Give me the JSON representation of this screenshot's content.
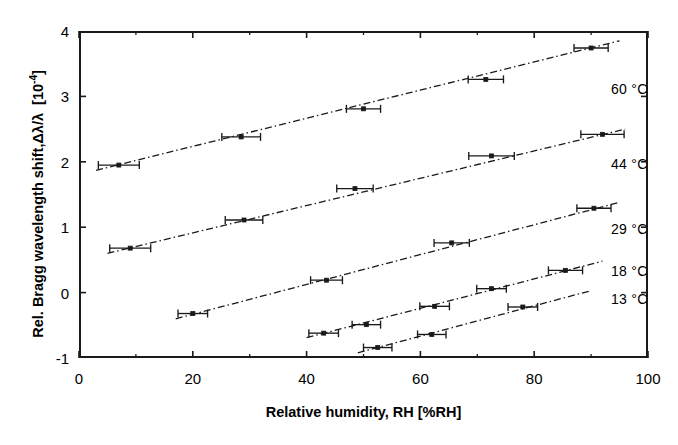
{
  "chart_data": {
    "type": "scatter",
    "title": "",
    "xlabel": "Relative humidity, RH   [%RH]",
    "ylabel": "Rel. Bragg wavelength shift,",
    "ylabel_symbol": "Δλ/λ",
    "ylabel_units": "[10",
    "ylabel_units_exp": "-4",
    "ylabel_units_close": "]",
    "xlim": [
      0,
      100
    ],
    "ylim": [
      -1,
      4
    ],
    "xticks": [
      0,
      20,
      40,
      60,
      80,
      100
    ],
    "xtick_labels": [
      "0",
      "20",
      "40",
      "60",
      "80",
      "100"
    ],
    "xminor_step": 10,
    "yticks": [
      -1,
      0,
      1,
      2,
      3,
      4
    ],
    "ytick_labels": [
      "-1",
      "0",
      "1",
      "2",
      "3",
      "4"
    ],
    "grid": false,
    "legend_position": "right-inline",
    "marker": "square",
    "errorbars": "x",
    "fit_line_style": "dash-dot",
    "series": [
      {
        "name": "60 °C",
        "label": "60 °C",
        "label_x": 93.5,
        "label_y": 3.12,
        "color": "#1a1a1a",
        "points": [
          {
            "x": 7.0,
            "y": 1.95,
            "xerr": 3.6
          },
          {
            "x": 28.5,
            "y": 2.38,
            "xerr": 3.4
          },
          {
            "x": 50.0,
            "y": 2.81,
            "xerr": 3.0
          },
          {
            "x": 71.5,
            "y": 3.26,
            "xerr": 3.1
          },
          {
            "x": 90.0,
            "y": 3.74,
            "xerr": 3.0
          }
        ],
        "fit": {
          "x0": 3.0,
          "y0": 1.87,
          "x1": 95.0,
          "y1": 3.85
        }
      },
      {
        "name": "44 °C",
        "label": "44 °C",
        "label_x": 93.5,
        "label_y": 1.97,
        "color": "#1a1a1a",
        "points": [
          {
            "x": 9.0,
            "y": 0.68,
            "xerr": 3.6
          },
          {
            "x": 29.0,
            "y": 1.11,
            "xerr": 3.3
          },
          {
            "x": 48.5,
            "y": 1.59,
            "xerr": 3.2
          },
          {
            "x": 72.5,
            "y": 2.09,
            "xerr": 4.0
          },
          {
            "x": 92.0,
            "y": 2.42,
            "xerr": 3.8
          }
        ],
        "fit": {
          "x0": 5.0,
          "y0": 0.6,
          "x1": 96.0,
          "y1": 2.5
        }
      },
      {
        "name": "29 °C",
        "label": "29 °C",
        "label_x": 93.5,
        "label_y": 0.97,
        "color": "#1a1a1a",
        "points": [
          {
            "x": 20.0,
            "y": -0.32,
            "xerr": 2.6
          },
          {
            "x": 43.5,
            "y": 0.19,
            "xerr": 2.8
          },
          {
            "x": 65.5,
            "y": 0.76,
            "xerr": 3.1
          },
          {
            "x": 90.5,
            "y": 1.29,
            "xerr": 3.0
          }
        ],
        "fit": {
          "x0": 17.0,
          "y0": -0.4,
          "x1": 95.0,
          "y1": 1.38
        }
      },
      {
        "name": "18 °C",
        "label": "18 °C",
        "label_x": 93.5,
        "label_y": 0.33,
        "color": "#1a1a1a",
        "points": [
          {
            "x": 43.0,
            "y": -0.62,
            "xerr": 2.6
          },
          {
            "x": 50.5,
            "y": -0.49,
            "xerr": 2.5
          },
          {
            "x": 62.5,
            "y": -0.21,
            "xerr": 2.6
          },
          {
            "x": 72.5,
            "y": 0.06,
            "xerr": 2.6
          },
          {
            "x": 85.5,
            "y": 0.34,
            "xerr": 3.0
          }
        ],
        "fit": {
          "x0": 40.0,
          "y0": -0.69,
          "x1": 92.0,
          "y1": 0.48
        }
      },
      {
        "name": "13 °C",
        "label": "13 °C",
        "label_x": 93.5,
        "label_y": -0.1,
        "color": "#1a1a1a",
        "points": [
          {
            "x": 52.5,
            "y": -0.84,
            "xerr": 2.5
          },
          {
            "x": 62.0,
            "y": -0.64,
            "xerr": 2.5
          },
          {
            "x": 78.0,
            "y": -0.22,
            "xerr": 2.6
          }
        ],
        "fit": {
          "x0": 49.0,
          "y0": -0.92,
          "x1": 90.0,
          "y1": 0.03
        }
      }
    ]
  }
}
